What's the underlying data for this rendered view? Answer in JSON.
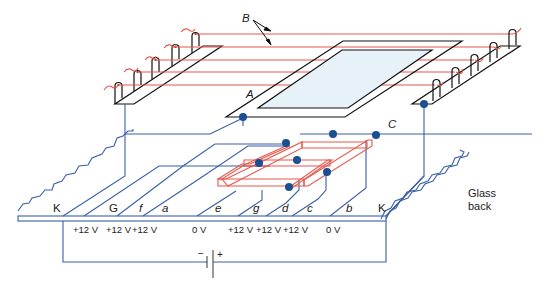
{
  "diagram": {
    "labels": {
      "B": "B",
      "A": "A",
      "C": "C",
      "glass_back_line1": "Glass",
      "glass_back_line2": "back",
      "battery_minus": "−",
      "battery_plus": "+"
    },
    "electrode_labels": [
      {
        "id": "K_left",
        "text": "K",
        "italic": false
      },
      {
        "id": "G",
        "text": "G",
        "italic": false
      },
      {
        "id": "f",
        "text": "f",
        "italic": true
      },
      {
        "id": "a",
        "text": "a",
        "italic": true
      },
      {
        "id": "e",
        "text": "e",
        "italic": true
      },
      {
        "id": "g",
        "text": "g",
        "italic": true
      },
      {
        "id": "d",
        "text": "d",
        "italic": true
      },
      {
        "id": "c",
        "text": "c",
        "italic": true
      },
      {
        "id": "b",
        "text": "b",
        "italic": true
      },
      {
        "id": "K_right",
        "text": "K",
        "italic": false
      }
    ],
    "voltages": [
      "+12 V",
      "+12 V",
      "+12 V",
      "0 V",
      "+12 V",
      "+12 V",
      "+12 V",
      "0 V"
    ],
    "colors": {
      "wire": "#3a5fa8",
      "filament": "#e8574a",
      "outline": "#111111",
      "contact": "#1a4f91",
      "screen_fill": "#e6f2f8"
    }
  }
}
